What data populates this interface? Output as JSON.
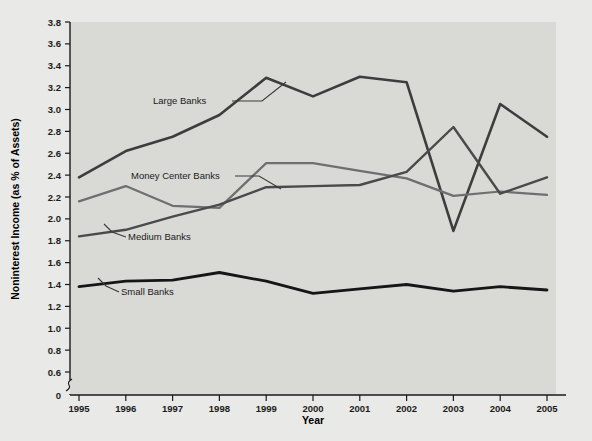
{
  "chart_data": {
    "type": "line",
    "title": "",
    "xlabel": "Year",
    "ylabel": "Noninterest Income (as % of Assets)",
    "categories": [
      "1995",
      "1996",
      "1997",
      "1998",
      "1999",
      "2000",
      "2001",
      "2002",
      "2003",
      "2004",
      "2005"
    ],
    "x": [
      1995,
      1996,
      1997,
      1998,
      1999,
      2000,
      2001,
      2002,
      2003,
      2004,
      2005
    ],
    "xlim": [
      1995,
      2005
    ],
    "ylim": [
      0.6,
      3.8
    ],
    "y_axis_break": true,
    "y_zero_label": "0",
    "yticks": [
      0.6,
      0.8,
      1.0,
      1.2,
      1.4,
      1.6,
      1.8,
      2.0,
      2.2,
      2.4,
      2.6,
      2.8,
      3.0,
      3.2,
      3.4,
      3.6,
      3.8
    ],
    "ytick_labels": [
      "0.6",
      "0.8",
      "1.0",
      "1.2",
      "1.4",
      "1.6",
      "1.8",
      "2.0",
      "2.2",
      "2.4",
      "2.6",
      "2.8",
      "3.0",
      "3.2",
      "3.4",
      "3.6",
      "3.8"
    ],
    "grid": false,
    "legend_position": "inline-annotations",
    "series": [
      {
        "name": "Large Banks",
        "color": "#3d3d3d",
        "width": 2.6,
        "values": [
          2.38,
          2.62,
          2.75,
          2.95,
          3.29,
          3.12,
          3.3,
          3.25,
          1.89,
          3.05,
          2.75
        ]
      },
      {
        "name": "Money Center Banks",
        "color": "#6f6f6f",
        "width": 2.2,
        "values": [
          2.16,
          2.3,
          2.12,
          2.1,
          2.51,
          2.51,
          2.44,
          2.37,
          2.21,
          2.25,
          2.22
        ]
      },
      {
        "name": "Medium Banks",
        "color": "#4a4a4a",
        "width": 2.4,
        "values": [
          1.84,
          1.9,
          2.02,
          2.13,
          2.29,
          2.3,
          2.31,
          2.43,
          2.84,
          2.23,
          2.38
        ]
      },
      {
        "name": "Small Banks",
        "color": "#161616",
        "width": 2.8,
        "values": [
          1.38,
          1.43,
          1.44,
          1.51,
          1.43,
          1.32,
          1.36,
          1.4,
          1.34,
          1.38,
          1.35
        ]
      }
    ],
    "annotations": [
      {
        "text": "Large Banks",
        "x": 153,
        "y": 104,
        "leader": "M232,101 L262,101 L286,82"
      },
      {
        "text": "Money Center Banks",
        "x": 131,
        "y": 179,
        "leader": "M235,176 L259,176 L281,189"
      },
      {
        "text": "Medium Banks",
        "x": 128,
        "y": 240,
        "leader": "M126,237 L112,232 L104,224"
      },
      {
        "text": "Small Banks",
        "x": 121,
        "y": 295,
        "leader": "M119,292 L106,286 L98,278"
      }
    ],
    "colors": {
      "page_background": "#ffffff",
      "figure_background": "#e9e9e7",
      "plot_background": "#d9d9d6",
      "axis": "#1a1a1a",
      "text": "#1b1b1b"
    }
  },
  "bleed_text": [
    {
      "text": "Noninterest Income and Expenses",
      "x": 218,
      "y": 318,
      "size": 13,
      "weight": "700"
    },
    {
      "text": "Noninterest income (as a percent of assets) has",
      "x": 218,
      "y": 338,
      "size": 9,
      "weight": "400"
    },
    {
      "text": "increased across all bank size groups since",
      "x": 218,
      "y": 350,
      "size": 9,
      "weight": "400"
    },
    {
      "text": "1995, with large banks showing the largest",
      "x": 218,
      "y": 362,
      "size": 9,
      "weight": "400"
    },
    {
      "text": "gains over the period.",
      "x": 218,
      "y": 374,
      "size": 9,
      "weight": "400"
    },
    {
      "text": "of noninterest income to average assets",
      "x": 180,
      "y": 238,
      "size": 8,
      "weight": "400"
    },
    {
      "text": "than the ratio for smaller banks",
      "x": 180,
      "y": 250,
      "size": 8,
      "weight": "400"
    }
  ]
}
